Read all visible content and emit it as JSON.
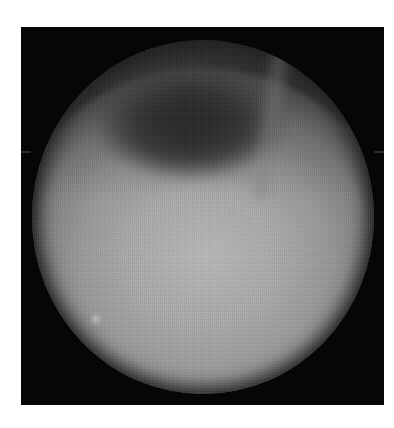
{
  "image": {
    "kind": "endoscopic-view",
    "colormode": "grayscale",
    "background_color": "#ffffff",
    "frame": {
      "color": "#060606",
      "x": 21,
      "y": 27,
      "width": 363,
      "height": 378
    },
    "field_of_view": {
      "shape": "circle",
      "center": [
        202,
        216
      ],
      "diameter": 345,
      "center_tone": "#b0b0b0",
      "edge_tone": "#555555"
    },
    "features": [
      {
        "name": "lumen",
        "description": "dark elliptical opening in upper half",
        "center": [
          165,
          105
        ],
        "tone": "#262626"
      },
      {
        "name": "mucosal-fold",
        "description": "faint lighter diagonal band at upper right",
        "center": [
          262,
          110
        ]
      },
      {
        "name": "bright-spot",
        "description": "small pale spot at lower left",
        "center": [
          93,
          315
        ]
      }
    ],
    "edge_ticks": [
      {
        "side": "left",
        "y": 152
      },
      {
        "side": "right",
        "y": 152
      }
    ]
  }
}
